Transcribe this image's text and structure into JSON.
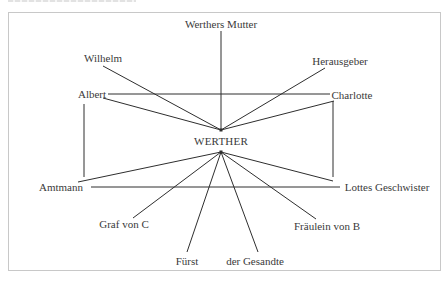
{
  "diagram": {
    "center": {
      "id": "werther",
      "label": "WERTHER",
      "x": 221,
      "y": 141
    },
    "nodes": [
      {
        "id": "werthers-mutter",
        "label": "Werthers Mutter",
        "x": 221,
        "y": 24
      },
      {
        "id": "wilhelm",
        "label": "Wilhelm",
        "x": 103,
        "y": 58
      },
      {
        "id": "herausgeber",
        "label": "Herausgeber",
        "x": 340,
        "y": 61
      },
      {
        "id": "albert",
        "label": "Albert",
        "x": 92,
        "y": 94
      },
      {
        "id": "charlotte",
        "label": "Charlotte",
        "x": 352,
        "y": 95
      },
      {
        "id": "amtmann",
        "label": "Amtmann",
        "x": 61,
        "y": 187
      },
      {
        "id": "lottes-geschwister",
        "label": "Lottes Geschwister",
        "x": 387,
        "y": 187
      },
      {
        "id": "graf-von-c",
        "label": "Graf von C",
        "x": 124,
        "y": 224
      },
      {
        "id": "fraulein-von-b",
        "label": "Fräulein von B",
        "x": 327,
        "y": 226
      },
      {
        "id": "furst",
        "label": "Fürst",
        "x": 187,
        "y": 261
      },
      {
        "id": "der-gesandte",
        "label": "der Gesandte",
        "x": 255,
        "y": 261
      }
    ],
    "edges": [
      {
        "from": "werthers-mutter",
        "x1": 221,
        "y1": 31,
        "x2": 221,
        "y2": 130
      },
      {
        "from": "wilhelm",
        "x1": 103,
        "y1": 66,
        "x2": 221,
        "y2": 130
      },
      {
        "from": "herausgeber",
        "x1": 325,
        "y1": 68,
        "x2": 221,
        "y2": 130
      },
      {
        "from": "albert",
        "x1": 103,
        "y1": 98,
        "x2": 221,
        "y2": 130
      },
      {
        "from": "charlotte",
        "x1": 334,
        "y1": 101,
        "x2": 221,
        "y2": 130
      },
      {
        "from": "albert-charlotte",
        "x1": 108,
        "y1": 94,
        "x2": 330,
        "y2": 94
      },
      {
        "from": "albert-amtmann",
        "x1": 84,
        "y1": 104,
        "x2": 84,
        "y2": 177
      },
      {
        "from": "charlotte-geschwister",
        "x1": 333,
        "y1": 101,
        "x2": 333,
        "y2": 177
      },
      {
        "from": "amtmann",
        "x1": 78,
        "y1": 182,
        "x2": 221,
        "y2": 152
      },
      {
        "from": "lottes-geschwister",
        "x1": 333,
        "y1": 181,
        "x2": 221,
        "y2": 152
      },
      {
        "from": "amtmann-geschwister",
        "x1": 91,
        "y1": 187,
        "x2": 340,
        "y2": 187
      },
      {
        "from": "graf-von-c",
        "x1": 133,
        "y1": 218,
        "x2": 221,
        "y2": 152
      },
      {
        "from": "fraulein-von-b",
        "x1": 316,
        "y1": 219,
        "x2": 221,
        "y2": 152
      },
      {
        "from": "furst",
        "x1": 187,
        "y1": 252,
        "x2": 221,
        "y2": 152
      },
      {
        "from": "der-gesandte",
        "x1": 258,
        "y1": 252,
        "x2": 221,
        "y2": 152
      }
    ],
    "hub_points": [
      {
        "x": 221,
        "y": 130
      },
      {
        "x": 221,
        "y": 152
      }
    ],
    "line_color": "#2e2e2e",
    "frame_color": "#c8c8c8"
  }
}
